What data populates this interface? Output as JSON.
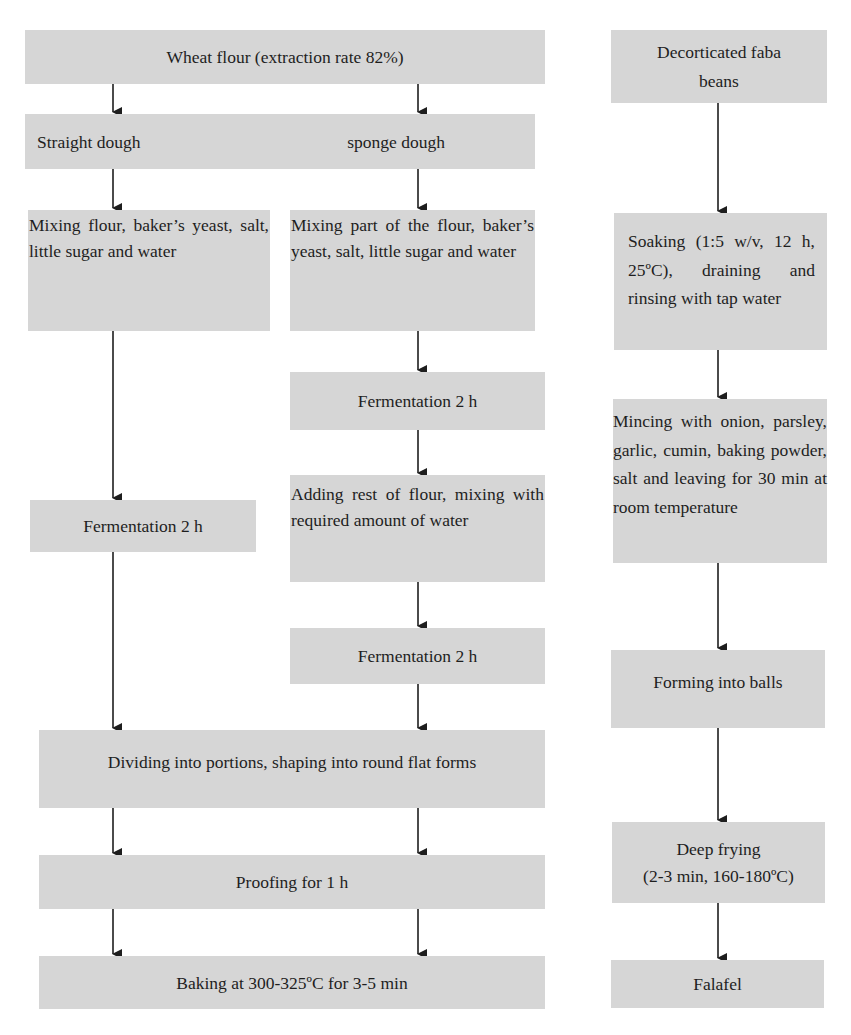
{
  "diagram": {
    "type": "flowchart",
    "left_flow": {
      "start": "Wheat flour (extraction rate 82%)",
      "methods": {
        "straight": "Straight dough",
        "sponge": "sponge dough"
      },
      "straight_branch": [
        "Mixing flour, baker’s yeast, salt, little sugar and water",
        "Fermentation 2 h"
      ],
      "sponge_branch": [
        "Mixing part of the flour, baker’s yeast, salt, little sugar and water",
        "Fermentation 2 h",
        "Adding rest of flour, mixing with required amount of water",
        "Fermentation 2 h"
      ],
      "common": [
        "Dividing into portions, shaping into round flat forms",
        "Proofing for 1 h",
        "Baking at 300-325ºC for 3-5 min"
      ]
    },
    "right_flow": {
      "steps": [
        "Decorticated faba beans",
        "Soaking (1:5 w/v, 12 h, 25ºC), draining and rinsing with tap water",
        "Mincing with onion, parsley, garlic, cumin, baking powder, salt and leaving for 30 min at room temperature",
        "Forming into balls",
        "Deep frying (2-3 min, 160-180ºC)",
        "Falafel"
      ],
      "deep_frying_line1": "Deep frying",
      "deep_frying_line2": "(2-3 min, 160-180ºC)",
      "faba_line1": "Decorticated faba",
      "faba_line2": "beans"
    },
    "colors": {
      "box_fill": "#d6d6d6",
      "arrow": "#1e1e1e",
      "text": "#1e1e1e"
    }
  }
}
